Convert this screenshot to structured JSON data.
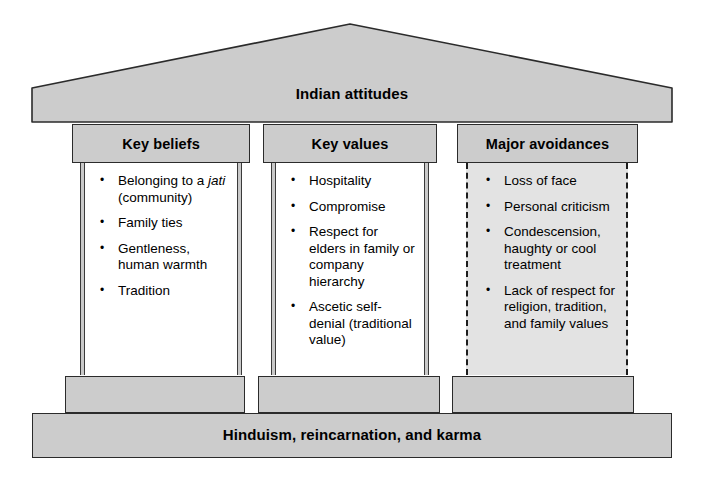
{
  "diagram": {
    "roof": {
      "title": "Indian attitudes",
      "fill": "#cccccc",
      "stroke": "#2b2b2b"
    },
    "base": {
      "label": "Hinduism, reincarnation, and karma",
      "fill": "#cccccc",
      "stroke": "#2b2b2b"
    },
    "columns": [
      {
        "heading": "Key beliefs",
        "style": "solid",
        "fill": "#ffffff",
        "items": [
          {
            "lead": "Belonging to a ",
            "italic": "jati",
            "tail": " (community)"
          },
          {
            "lead": "Family ties",
            "italic": "",
            "tail": ""
          },
          {
            "lead": "Gentleness, human warmth",
            "italic": "",
            "tail": ""
          },
          {
            "lead": "Tradition",
            "italic": "",
            "tail": ""
          }
        ]
      },
      {
        "heading": "Key values",
        "style": "solid",
        "fill": "#ffffff",
        "items": [
          {
            "lead": "Hospitality",
            "italic": "",
            "tail": ""
          },
          {
            "lead": "Compromise",
            "italic": "",
            "tail": ""
          },
          {
            "lead": "Respect for elders in family or company hierarchy",
            "italic": "",
            "tail": ""
          },
          {
            "lead": "Ascetic self-denial (traditional value)",
            "italic": "",
            "tail": ""
          }
        ]
      },
      {
        "heading": "Major avoidances",
        "style": "dashed",
        "fill": "#e3e3e3",
        "items": [
          {
            "lead": "Loss of face",
            "italic": "",
            "tail": ""
          },
          {
            "lead": "Personal criticism",
            "italic": "",
            "tail": ""
          },
          {
            "lead": "Condescension, haughty or cool treatment",
            "italic": "",
            "tail": ""
          },
          {
            "lead": "Lack of respect for religion, tradition, and family values",
            "italic": "",
            "tail": ""
          }
        ]
      }
    ]
  }
}
